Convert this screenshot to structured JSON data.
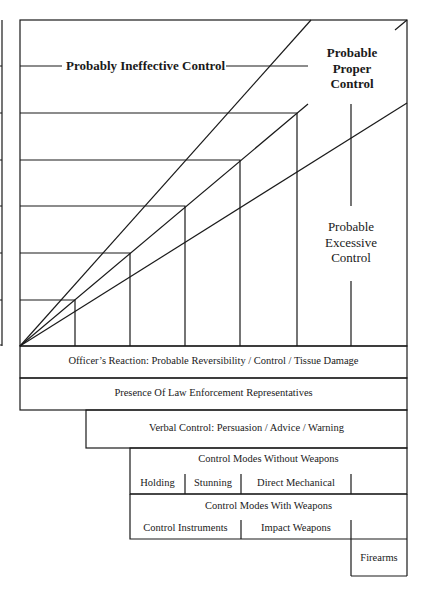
{
  "diagram": {
    "zones": {
      "ineffective": "Probably Ineffective Control",
      "proper": [
        "Probable",
        "Proper",
        "Control"
      ],
      "excessive": [
        "Probable",
        "Excessive",
        "Control"
      ]
    },
    "bands": {
      "officers_reaction": "Officer’s Reaction: Probable Reversibility / Control / Tissue Damage",
      "presence": "Presence Of Law Enforcement Representatives",
      "verbal": "Verbal Control: Persuasion / Advice / Warning",
      "without_weapons": {
        "title": "Control Modes Without Weapons",
        "items": [
          "Holding",
          "Stunning",
          "Direct Mechanical"
        ]
      },
      "with_weapons": {
        "title": "Control Modes With Weapons",
        "items": [
          "Control Instruments",
          "Impact Weapons"
        ]
      },
      "firearms": "Firearms"
    },
    "colors": {
      "line": "#1a1a1a",
      "background": "#ffffff"
    }
  }
}
